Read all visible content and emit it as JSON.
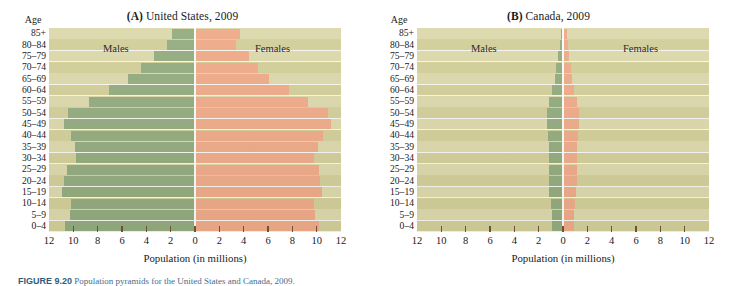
{
  "figure": {
    "caption_label": "FIGURE 9.20",
    "caption_text": "Population pyramids for the United States and Canada, 2009."
  },
  "colors": {
    "male_bar": "#93ab7f",
    "female_bar": "#eeaa88",
    "plot_background": "#d9d5a4",
    "band_alt": "#dcd8ab",
    "gridline": "#ffffff",
    "tick": "#6b5338"
  },
  "panels": [
    {
      "id": "panel-a",
      "letter": "A",
      "title": "(A) United States, 2009",
      "title_prefix": "(A)",
      "title_rest": " United States, 2009",
      "age_axis_label": "Age",
      "male_label": "Males",
      "female_label": "Females",
      "x_axis_label": "Population (in millions)"
    },
    {
      "id": "panel-b",
      "letter": "B",
      "title": "(B) Canada, 2009",
      "title_prefix": "(B)",
      "title_rest": " Canada, 2009",
      "age_axis_label": "Age",
      "male_label": "Males",
      "female_label": "Females",
      "x_axis_label": "Population (in millions)"
    }
  ],
  "chart_data": [
    {
      "type": "bar",
      "subtype": "population-pyramid",
      "title": "(A) United States, 2009",
      "xlabel": "Population (in millions)",
      "ylabel": "Age",
      "xlim": [
        -12,
        12
      ],
      "xticks": [
        12,
        10,
        8,
        6,
        4,
        2,
        0,
        2,
        4,
        6,
        8,
        10,
        12
      ],
      "xtick_labels": [
        "12",
        "10",
        "8",
        "6",
        "4",
        "2",
        "0",
        "2",
        "4",
        "6",
        "8",
        "10",
        "12"
      ],
      "grid": true,
      "legend_position": "in-plot",
      "categories": [
        "85+",
        "80–84",
        "75–79",
        "70–74",
        "65–69",
        "60–64",
        "55–59",
        "50–54",
        "45–49",
        "40–44",
        "35–39",
        "30–34",
        "25–29",
        "20–24",
        "15–19",
        "10–14",
        "5–9",
        "0–4"
      ],
      "series": [
        {
          "name": "Males",
          "values": [
            1.9,
            2.3,
            3.4,
            4.4,
            5.5,
            7.1,
            8.7,
            10.4,
            10.8,
            10.2,
            9.9,
            9.8,
            10.5,
            10.8,
            10.9,
            10.2,
            10.3,
            10.7
          ]
        },
        {
          "name": "Females",
          "values": [
            3.7,
            3.4,
            4.4,
            5.2,
            6.1,
            7.7,
            9.3,
            10.9,
            11.2,
            10.5,
            10.1,
            9.8,
            10.2,
            10.3,
            10.4,
            9.8,
            9.9,
            10.2
          ]
        }
      ]
    },
    {
      "type": "bar",
      "subtype": "population-pyramid",
      "title": "(B) Canada, 2009",
      "xlabel": "Population (in millions)",
      "ylabel": "Age",
      "xlim": [
        -12,
        12
      ],
      "xticks": [
        12,
        10,
        8,
        6,
        4,
        2,
        0,
        2,
        4,
        6,
        8,
        10,
        12
      ],
      "xtick_labels": [
        "12",
        "10",
        "8",
        "6",
        "4",
        "2",
        "0",
        "2",
        "4",
        "6",
        "8",
        "10",
        "12"
      ],
      "grid": true,
      "legend_position": "in-plot",
      "categories": [
        "85+",
        "80–84",
        "75–79",
        "70–74",
        "65–69",
        "60–64",
        "55–59",
        "50–54",
        "45–49",
        "40–44",
        "35–39",
        "30–34",
        "25–29",
        "20–24",
        "15–19",
        "10–14",
        "5–9",
        "0–4"
      ],
      "series": [
        {
          "name": "Males",
          "values": [
            0.18,
            0.27,
            0.4,
            0.54,
            0.68,
            0.9,
            1.12,
            1.28,
            1.32,
            1.2,
            1.12,
            1.14,
            1.18,
            1.16,
            1.12,
            1.02,
            0.92,
            0.92
          ]
        },
        {
          "name": "Females",
          "values": [
            0.33,
            0.4,
            0.5,
            0.62,
            0.73,
            0.94,
            1.15,
            1.3,
            1.33,
            1.21,
            1.13,
            1.14,
            1.16,
            1.12,
            1.07,
            0.97,
            0.88,
            0.88
          ]
        }
      ]
    }
  ]
}
